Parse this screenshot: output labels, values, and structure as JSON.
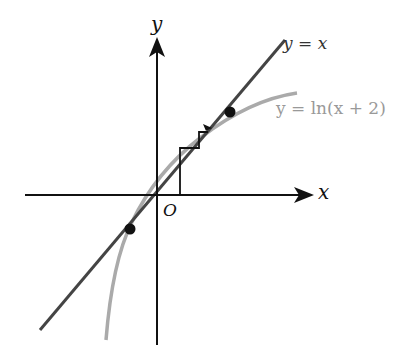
{
  "diagram": {
    "type": "function-graph",
    "labels": {
      "y_axis": "y",
      "x_axis": "x",
      "origin": "O",
      "line": "y = x",
      "curve": "y = ln(x + 2)"
    },
    "colors": {
      "axes": "#111111",
      "line": "#444444",
      "curve": "#aaaaaa",
      "points": "#111111",
      "curve_label": "#999999",
      "line_label": "#333333"
    },
    "intersection_points": [
      {
        "x_px": 230,
        "y_px": 112
      },
      {
        "x_px": 130,
        "y_px": 229
      }
    ]
  }
}
